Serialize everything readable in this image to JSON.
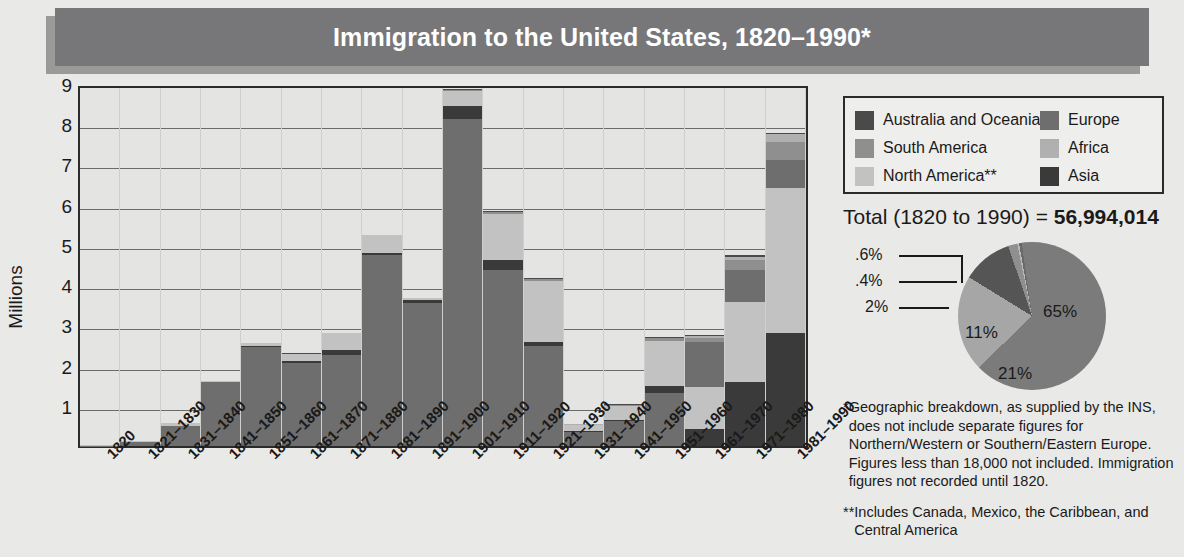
{
  "title": "Immigration to the United States, 1820–1990*",
  "legend": {
    "items": [
      {
        "label": "Australia and Oceania",
        "color": "#4a4a4a"
      },
      {
        "label": "Europe",
        "color": "#6e6e6e"
      },
      {
        "label": "South America",
        "color": "#8f8f8f"
      },
      {
        "label": "Africa",
        "color": "#b0b0b0"
      },
      {
        "label": "North America**",
        "color": "#c2c2c2"
      },
      {
        "label": "Asia",
        "color": "#3a3a3a"
      }
    ]
  },
  "total": {
    "prefix": "Total (1820 to 1990) = ",
    "value": "56,994,014"
  },
  "footnotes": [
    {
      "mark": "*",
      "text": "Geographic breakdown, as supplied by the INS, does not include separate figures for Northern/Western or Southern/Eastern Europe. Figures less than 18,000 not included. Immigration figures not recorded until 1820."
    },
    {
      "mark": "**",
      "text": "Includes Canada, Mexico, the Caribbean, and Central America"
    }
  ],
  "chart_data": [
    {
      "type": "bar",
      "subtype": "stacked-bar",
      "title": "Immigration to the United States, 1820–1990*",
      "xlabel": "",
      "ylabel": "Millions",
      "ylim": [
        0,
        9
      ],
      "yticks": [
        1,
        2,
        3,
        4,
        5,
        6,
        7,
        8,
        9
      ],
      "grid": true,
      "legend_position": "top-right",
      "categories": [
        "1820",
        "1821–1830",
        "1831–1840",
        "1841–1850",
        "1851–1860",
        "1861–1870",
        "1871–1880",
        "1881–1890",
        "1891–1900",
        "1901–1910",
        "1911–1920",
        "1921–1930",
        "1931–1940",
        "1941–1950",
        "1951–1960",
        "1961–1970",
        "1971–1980",
        "1981–1990"
      ],
      "series": [
        {
          "name": "Europe",
          "color": "#6e6e6e",
          "values": [
            0.008,
            0.1,
            0.5,
            1.6,
            2.45,
            2.06,
            2.27,
            4.74,
            3.56,
            8.14,
            4.38,
            2.48,
            0.35,
            0.62,
            1.33,
            1.12,
            0.8,
            0.7
          ]
        },
        {
          "name": "Asia",
          "color": "#3a3a3a",
          "values": [
            0.0,
            0.0,
            0.0,
            0.0,
            0.042,
            0.065,
            0.124,
            0.07,
            0.075,
            0.324,
            0.247,
            0.112,
            0.016,
            0.032,
            0.15,
            0.428,
            1.59,
            2.8
          ]
        },
        {
          "name": "North America**",
          "color": "#c2c2c2",
          "values": [
            0.01,
            0.03,
            0.07,
            0.01,
            0.075,
            0.167,
            0.404,
            0.427,
            0.039,
            0.362,
            1.14,
            1.52,
            0.16,
            0.35,
            1.12,
            1.05,
            1.98,
            3.62
          ]
        },
        {
          "name": "South America",
          "color": "#8f8f8f",
          "values": [
            0.0,
            0.003,
            0.003,
            0.003,
            0.002,
            0.002,
            0.001,
            0.002,
            0.001,
            0.018,
            0.042,
            0.043,
            0.008,
            0.022,
            0.08,
            0.1,
            0.25,
            0.45
          ]
        },
        {
          "name": "Africa",
          "color": "#b0b0b0",
          "values": [
            0.0,
            0.0,
            0.0,
            0.0,
            0.0,
            0.0,
            0.0,
            0.001,
            0.001,
            0.008,
            0.009,
            0.007,
            0.002,
            0.007,
            0.014,
            0.029,
            0.081,
            0.177
          ]
        },
        {
          "name": "Australia and Oceania",
          "color": "#4a4a4a",
          "values": [
            0.0,
            0.0,
            0.0,
            0.0,
            0.0,
            0.01,
            0.01,
            0.01,
            0.004,
            0.013,
            0.014,
            0.009,
            0.003,
            0.015,
            0.013,
            0.025,
            0.042,
            0.042
          ]
        }
      ],
      "totals": [
        0.02,
        0.14,
        0.6,
        1.55,
        2.6,
        2.31,
        2.81,
        5.25,
        3.69,
        8.8,
        5.74,
        4.11,
        0.53,
        1.04,
        2.52,
        3.32,
        4.49,
        7.34
      ]
    },
    {
      "type": "pie",
      "title": "Total (1820 to 1990) = 56,994,014",
      "labels": [
        "Europe",
        "North America**",
        "Asia",
        "South America",
        "Africa",
        "Australia and Oceania"
      ],
      "display_values": [
        "65%",
        "21%",
        "11%",
        "2%",
        ".4%",
        ".6%"
      ],
      "values": [
        65,
        21,
        11,
        2,
        0.4,
        0.6
      ],
      "colors": [
        "#7b7b7b",
        "#a6a6a6",
        "#555555",
        "#8f8f8f",
        "#b8b8b8",
        "#6a6a6a"
      ],
      "callouts": [
        ".6%",
        ".4%",
        "2%"
      ],
      "inner_labels": [
        "65%",
        "21%",
        "11%"
      ]
    }
  ]
}
